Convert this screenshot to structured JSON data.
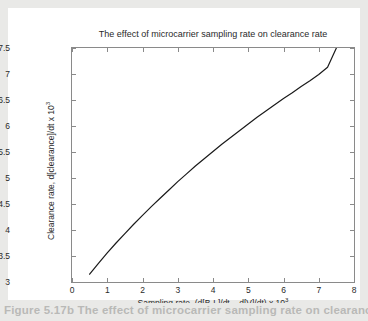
{
  "figure": {
    "title": "The effect of microcarrier sampling rate on clearance rate",
    "caption": "Figure 5.17b  The effect of microcarrier sampling rate on clearance rate"
  },
  "axes": {
    "x": {
      "label_prefix": "Sampling rate, (d[B·L]/dt – d[V]/dt)  x  10",
      "label_exponent": "3",
      "ticks": [
        "0",
        "1",
        "2",
        "3",
        "4",
        "5",
        "6",
        "7",
        "8"
      ]
    },
    "y": {
      "label_prefix": "Clearance rate, d[clearance]/dt  x  10",
      "label_exponent": "3",
      "ticks": [
        "3",
        "3.5",
        "4",
        "4.5",
        "5",
        "5.5",
        "6",
        "6.5",
        "7",
        "7.5"
      ]
    }
  },
  "colors": {
    "page_background": "#e9e9e7",
    "figure_background": "#ffffff",
    "axis": "#8a8a8a",
    "curve": "#1a1a1a",
    "text": "#2a2a2a",
    "caption_text": "#b9b9b7"
  },
  "chart_data": {
    "type": "line",
    "title": "The effect of microcarrier sampling rate on clearance rate",
    "xlabel": "Sampling rate, (d[B·L]/dt – d[V]/dt)  x  10^3",
    "ylabel": "Clearance rate, d[clearance]/dt  x  10^3",
    "xlim": [
      0,
      8
    ],
    "ylim": [
      3,
      7.5
    ],
    "xticks": [
      0,
      1,
      2,
      3,
      4,
      5,
      6,
      7,
      8
    ],
    "yticks": [
      3,
      3.5,
      4,
      4.5,
      5,
      5.5,
      6,
      6.5,
      7,
      7.5
    ],
    "grid": false,
    "legend": null,
    "series": [
      {
        "name": "clearance rate",
        "x": [
          0.5,
          0.75,
          1.0,
          1.25,
          1.5,
          1.75,
          2.0,
          2.25,
          2.5,
          2.75,
          3.0,
          3.25,
          3.5,
          3.75,
          4.0,
          4.25,
          4.5,
          4.75,
          5.0,
          5.25,
          5.5,
          5.75,
          6.0,
          6.25,
          6.5,
          6.75,
          7.0,
          7.25,
          7.5
        ],
        "y": [
          3.15,
          3.36,
          3.56,
          3.75,
          3.93,
          4.11,
          4.28,
          4.45,
          4.61,
          4.77,
          4.93,
          5.08,
          5.23,
          5.37,
          5.51,
          5.65,
          5.78,
          5.91,
          6.04,
          6.17,
          6.29,
          6.41,
          6.53,
          6.64,
          6.76,
          6.87,
          6.99,
          7.13,
          7.5
        ]
      }
    ]
  }
}
